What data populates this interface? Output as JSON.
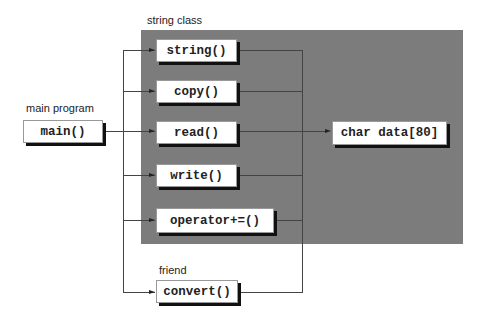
{
  "labels": {
    "string_class": "string class",
    "main_program": "main program",
    "friend": "friend"
  },
  "boxes": {
    "main": "main()",
    "string": "string()",
    "copy": "copy()",
    "read": "read()",
    "write": "write()",
    "operator": "operator+=()",
    "convert": "convert()",
    "data": "char data[80]"
  },
  "colors": {
    "class_region": "#7c7c7c",
    "box_fill": "#ffffff",
    "box_shadow": "#111111",
    "connector": "#444444"
  }
}
